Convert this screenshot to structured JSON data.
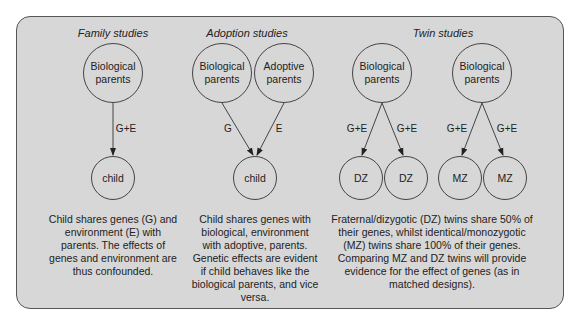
{
  "sections": [
    {
      "title": "Family studies",
      "parents": [
        {
          "label": "Biological parents"
        }
      ],
      "children": [
        {
          "label": "child"
        }
      ],
      "edges": [
        {
          "label": "G+E"
        }
      ],
      "caption": "Child shares genes (G) and environment (E) with parents. The effects of genes and environment are thus confounded."
    },
    {
      "title": "Adoption studies",
      "parents": [
        {
          "label": "Biological parents"
        },
        {
          "label": "Adoptive parents"
        }
      ],
      "children": [
        {
          "label": "child"
        }
      ],
      "edges": [
        {
          "label": "G"
        },
        {
          "label": "E"
        }
      ],
      "caption": "Child shares genes with biological, environment with adoptive, parents. Genetic effects are evident if child behaves like the biological parents, and vice versa."
    },
    {
      "title": "Twin studies",
      "parents": [
        {
          "label": "Biological parents"
        },
        {
          "label": "Biological parents"
        }
      ],
      "children": [
        {
          "label": "DZ"
        },
        {
          "label": "DZ"
        },
        {
          "label": "MZ"
        },
        {
          "label": "MZ"
        }
      ],
      "edges": [
        {
          "label": "G+E"
        },
        {
          "label": "G+E"
        },
        {
          "label": "G+E"
        },
        {
          "label": "G+E"
        }
      ],
      "caption": "Fraternal/dizygotic (DZ) twins share 50% of their genes, whilst identical/monozygotic (MZ) twins share 100% of their genes. Comparing MZ and DZ twins will provide evidence for the effect of genes (as in matched designs)."
    }
  ],
  "colors": {
    "panel_fill": "#d7d7d7",
    "stroke": "#444444",
    "text": "#222222"
  }
}
